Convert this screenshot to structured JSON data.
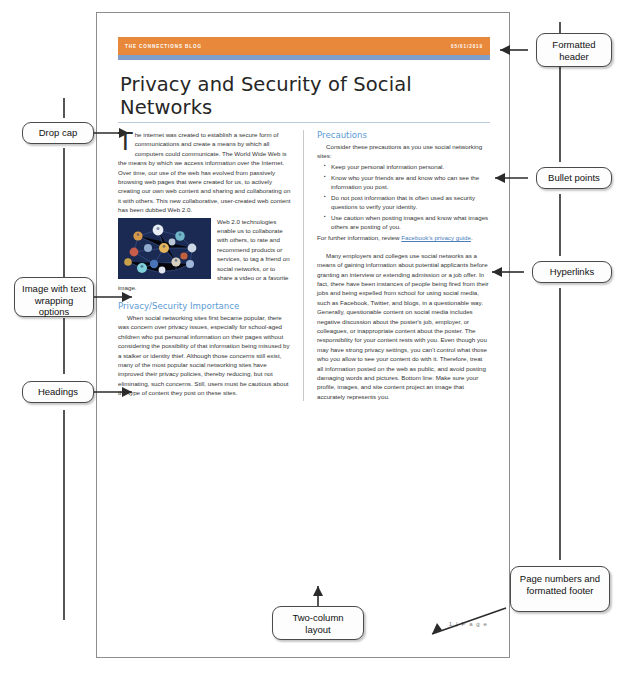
{
  "document": {
    "header": {
      "blog_name": "THE CONNECTIONS BLOG",
      "date": "05/01/2019",
      "bar_color": "#e8883a",
      "rule_color": "#7f9fca"
    },
    "title": "Privacy and Security of Social Networks",
    "left_column": {
      "dropcap": "T",
      "intro_paragraph": "he internet was created to establish a secure form of communications and create a means by which all computers could communicate. The World Wide Web is the means by which we access information over the Internet. Over time, our use of the web has evolved from passively browsing web pages that were created for us, to actively creating our own web content and sharing and collaborating on it with others. This new collaborative, user-created web content has been dubbed Web 2.0.",
      "image_alt": "social-network-avatars-graphic",
      "wrapped_paragraph": "Web 2.0 technologies enable us to collaborate with others, to rate and recommend products or services, to tag a friend on social networks, or to share a video or a favorite image.",
      "heading": "Privacy/Security Importance",
      "body_paragraph": "When social networking sites first became popular, there was concern over privacy issues, especially for school-aged children who put personal information on their pages without considering the possibility of that information being misused by a stalker or identity thief. Although those concerns still exist, many of the most popular social networking sites have improved their privacy policies, thereby reducing, but not eliminating, such concerns. Still, users must be cautious about the type of content they post on these sites."
    },
    "right_column": {
      "heading": "Precautions",
      "lead_in": "Consider these precautions as you use social networking sites:",
      "bullets": [
        "Keep your personal information personal.",
        "Know who your friends are and know who can see the information you post.",
        "Do not post information that is often used as security questions to verify your identity.",
        "Use caution when posting images and know what images others are posting of you."
      ],
      "link_sentence_prefix": "For further information, review ",
      "link_text": "Facebook's privacy guide",
      "link_sentence_suffix": ".",
      "closing_paragraph": "Many employers and colleges use social networks as a means of gaining information about potential applicants before granting an interview or extending admission or a job offer. In fact, there have been instances of people being fired from their jobs and being expelled from school for using social media, such as Facebook, Twitter, and blogs, in a questionable way. Generally, questionable content on social media includes negative discussion about the poster's job, employer, or colleagues, or inappropriate content about the poster. The responsibility for your content rests with you. Even though you may have strong privacy settings, you can't control what those who you allow to see your content do with it. Therefore, treat all information posted on the web as public, and avoid posting damaging words and pictures. Bottom line: Make sure your profile, images, and site content project an image that accurately represents you."
    },
    "footer": {
      "page_number": "1 | P a g e"
    }
  },
  "annotations": [
    {
      "id": "drop-cap",
      "label": "Drop cap"
    },
    {
      "id": "image-wrapping",
      "label": "Image with text wrapping options"
    },
    {
      "id": "headings",
      "label": "Headings"
    },
    {
      "id": "formatted-header",
      "label": "Formatted header"
    },
    {
      "id": "bullet-points",
      "label": "Bullet points"
    },
    {
      "id": "hyperlinks",
      "label": "Hyperlinks"
    },
    {
      "id": "two-column",
      "label": "Two-column layout"
    },
    {
      "id": "page-footer",
      "label": "Page numbers and formatted footer"
    }
  ]
}
